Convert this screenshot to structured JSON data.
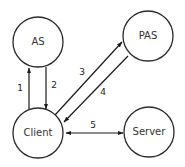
{
  "diagram": {
    "colors": {
      "stroke": "#2b2b2b",
      "text": "#333333",
      "background": "#ffffff"
    },
    "nodes": [
      {
        "id": "as",
        "label": "AS",
        "cx": 38,
        "cy": 42,
        "r": 25
      },
      {
        "id": "pas",
        "label": "PAS",
        "cx": 148,
        "cy": 36,
        "r": 25
      },
      {
        "id": "client",
        "label": "Client",
        "cx": 38,
        "cy": 133,
        "r": 25
      },
      {
        "id": "server",
        "label": "Server",
        "cx": 149,
        "cy": 132,
        "r": 25
      }
    ],
    "edges": [
      {
        "id": "e1",
        "label": "1",
        "from": "Client",
        "to": "AS",
        "direction": "up"
      },
      {
        "id": "e2",
        "label": "2",
        "from": "AS",
        "to": "Client",
        "direction": "down"
      },
      {
        "id": "e3",
        "label": "3",
        "from": "Client",
        "to": "PAS",
        "direction": "forward"
      },
      {
        "id": "e4",
        "label": "4",
        "from": "PAS",
        "to": "Client",
        "direction": "backward"
      },
      {
        "id": "e5",
        "label": "5",
        "from": "Client",
        "to": "Server",
        "direction": "bidirectional"
      }
    ]
  }
}
